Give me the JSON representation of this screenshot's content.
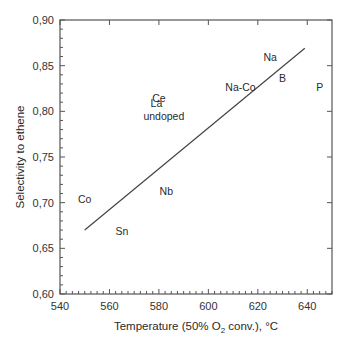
{
  "chart_data": {
    "type": "scatter",
    "title": "",
    "xlabel": "Temperature (50% O2 conv.), °C",
    "xlabel_parts": {
      "pre": "Temperature (50% O",
      "sub": "2",
      "post": " conv.), °C"
    },
    "ylabel": "Selectivity to ethene",
    "xlim": [
      540,
      650
    ],
    "ylim": [
      0.6,
      0.9
    ],
    "x_ticks": [
      540,
      560,
      580,
      600,
      620,
      640
    ],
    "x_tick_labels": [
      "540",
      "560",
      "580",
      "600",
      "620",
      "640"
    ],
    "y_ticks": [
      0.6,
      0.65,
      0.7,
      0.75,
      0.8,
      0.85,
      0.9
    ],
    "y_tick_labels": [
      "0,60",
      "0,65",
      "0,70",
      "0,75",
      "0,80",
      "0,85",
      "0,90"
    ],
    "grid": false,
    "legend": null,
    "points": [
      {
        "label": "Na",
        "x": 625,
        "y": 0.86
      },
      {
        "label": "B",
        "x": 630,
        "y": 0.836
      },
      {
        "label": "P",
        "x": 645,
        "y": 0.827
      },
      {
        "label": "Na-Co",
        "x": 613,
        "y": 0.827
      },
      {
        "label": "Ce",
        "x": 580,
        "y": 0.815
      },
      {
        "label": "La",
        "x": 579,
        "y": 0.809
      },
      {
        "label": "undoped",
        "x": 582,
        "y": 0.795
      },
      {
        "label": "Nb",
        "x": 583,
        "y": 0.713
      },
      {
        "label": "Co",
        "x": 550,
        "y": 0.704
      },
      {
        "label": "Sn",
        "x": 565,
        "y": 0.669
      }
    ],
    "trendline": {
      "x": [
        550,
        639
      ],
      "y": [
        0.67,
        0.869
      ]
    },
    "colors": {
      "axis": "#555555",
      "line": "#444444",
      "text": "#2a2a2a"
    }
  }
}
